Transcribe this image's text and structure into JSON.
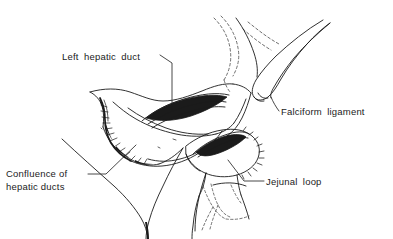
{
  "figure": {
    "type": "medical-line-drawing",
    "background_color": "#ffffff",
    "ink_color": "#1b1b1b"
  },
  "labels": [
    {
      "id": "left-hepatic-duct",
      "text": "Left hepatic duct",
      "lines": [
        "Left hepatic duct"
      ]
    },
    {
      "id": "falciform-ligament",
      "text": "Falciform ligament",
      "lines": [
        "Falciform ligament"
      ]
    },
    {
      "id": "confluence-of-hepatic-ducts",
      "text": "Confluence of hepatic ducts",
      "line1": "Confluence of",
      "line2": "hepatic ducts"
    },
    {
      "id": "jejunal-loop",
      "text": "Jejunal loop",
      "lines": [
        "Jejunal loop"
      ]
    }
  ],
  "structures": [
    {
      "id": "liver-cut-surface",
      "name": "Liver cut surface"
    },
    {
      "id": "left-hepatic-duct-opening",
      "name": "Opened left hepatic duct lumen"
    },
    {
      "id": "duct-confluence",
      "name": "Confluence of hepatic ducts"
    },
    {
      "id": "falciform-ligament-band",
      "name": "Falciform ligament"
    },
    {
      "id": "liver-hidden-outline",
      "name": "Hidden liver contour (dashed)"
    },
    {
      "id": "jejunal-loop-body",
      "name": "Jejunal loop"
    },
    {
      "id": "jejunal-loop-opening",
      "name": "Jejunal enterotomy opening"
    },
    {
      "id": "mesenteric-vessels",
      "name": "Mesenteric vessels (dashed)"
    }
  ]
}
